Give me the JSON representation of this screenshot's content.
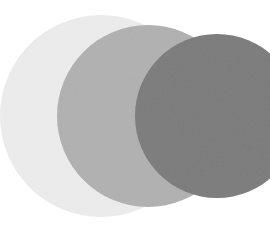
{
  "circles": [
    {
      "name": "light",
      "cx": 101,
      "cy": 116,
      "r": 101,
      "color": "#ececec"
    },
    {
      "name": "medium",
      "cx": 148,
      "cy": 116,
      "r": 91,
      "color": "#b1b1b1"
    },
    {
      "name": "dark",
      "cx": 217,
      "cy": 116,
      "r": 82,
      "color": "#7b7b7b"
    }
  ],
  "background": "#ffffff"
}
